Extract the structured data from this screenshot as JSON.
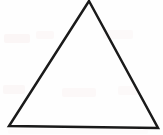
{
  "figure": {
    "title": "Triangle",
    "description": "Outline drawing of a triangle",
    "background_color": "#fefefe",
    "stroke_color": "#1a1a1a",
    "fill_color": "none",
    "stroke_width": 2.5,
    "canvas": {
      "width": 163,
      "height": 135
    },
    "shape": {
      "name": "triangle",
      "type": "polygon",
      "sides": 3,
      "closed": true,
      "vertices": [
        {
          "label": "apex",
          "x": 89,
          "y": 1
        },
        {
          "label": "bottom-right",
          "x": 158,
          "y": 128
        },
        {
          "label": "bottom-left",
          "x": 9,
          "y": 126
        }
      ],
      "points_attr": "89,1 158,128 9,126"
    },
    "artifacts": {
      "present": true,
      "kind": "scan-ghosting",
      "color": "#fbf7f7"
    }
  }
}
